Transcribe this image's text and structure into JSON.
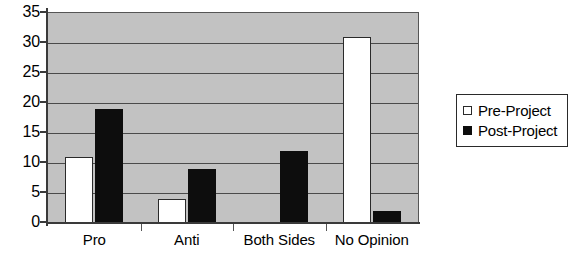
{
  "chart_data": {
    "type": "bar",
    "title": "",
    "subtitle": "",
    "xlabel": "",
    "ylabel": "",
    "categories": [
      "Pro",
      "Anti",
      "Both Sides",
      "No Opinion"
    ],
    "series": [
      {
        "name": "Pre-Project",
        "values": [
          11,
          4,
          0,
          31
        ],
        "color": "#ffffff"
      },
      {
        "name": "Post-Project",
        "values": [
          19,
          9,
          12,
          2
        ],
        "color": "#0d0d0d"
      }
    ],
    "ylim": [
      0,
      35
    ],
    "yticks": [
      0,
      5,
      10,
      15,
      20,
      25,
      30,
      35
    ],
    "ytick_labels": [
      "0",
      "5",
      "10",
      "15",
      "20",
      "25",
      "30",
      "35"
    ],
    "grid": true,
    "grid_axis": "y",
    "legend_position": "right",
    "plot_background": "#c2c2c2",
    "figure_background": "#ffffff",
    "axis_color": "#3a3a3a",
    "gridline_color": "#4a4a4a"
  },
  "legend": {
    "entries": [
      {
        "label": "Pre-Project",
        "marker": "open-square-icon"
      },
      {
        "label": "Post-Project",
        "marker": "filled-square-icon"
      }
    ]
  }
}
